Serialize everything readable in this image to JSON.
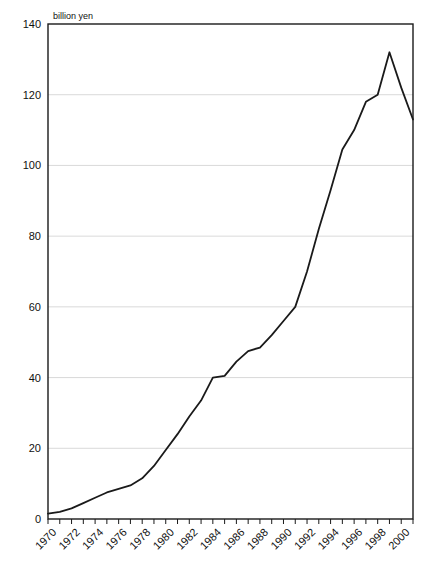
{
  "chart_data": {
    "type": "line",
    "title": "",
    "subtitle": "",
    "xlabel": "",
    "ylabel": "",
    "unit_label": "billion yen",
    "grid": true,
    "legend": "none",
    "xlim": [
      1970,
      2001
    ],
    "ylim": [
      0,
      140
    ],
    "ytick_values": [
      0,
      20,
      40,
      60,
      80,
      100,
      120,
      140
    ],
    "ytick_labels": [
      "0",
      "20",
      "40",
      "60",
      "80",
      "100",
      "120",
      "140"
    ],
    "xtick_labels": [
      "1970",
      "1972",
      "1974",
      "1976",
      "1978",
      "1980",
      "1982",
      "1984",
      "1986",
      "1988",
      "1990",
      "1992",
      "1994",
      "1996",
      "1998",
      "2000"
    ],
    "xtick_label_years": [
      1970,
      1972,
      1974,
      1976,
      1978,
      1980,
      1982,
      1984,
      1986,
      1988,
      1990,
      1992,
      1994,
      1996,
      1998,
      2000
    ],
    "xtick_minor_years": [
      1970,
      1971,
      1972,
      1973,
      1974,
      1975,
      1976,
      1977,
      1978,
      1979,
      1980,
      1981,
      1982,
      1983,
      1984,
      1985,
      1986,
      1987,
      1988,
      1989,
      1990,
      1991,
      1992,
      1993,
      1994,
      1995,
      1996,
      1997,
      1998,
      1999,
      2000,
      2001
    ],
    "series": [
      {
        "name": "billion yen",
        "color": "#1a1a1a",
        "x": [
          1970,
          1971,
          1972,
          1973,
          1974,
          1975,
          1976,
          1977,
          1978,
          1979,
          1980,
          1981,
          1982,
          1983,
          1984,
          1985,
          1986,
          1987,
          1988,
          1989,
          1990,
          1991,
          1992,
          1993,
          1994,
          1995,
          1996,
          1997,
          1998,
          1999,
          2000,
          2001
        ],
        "values": [
          1.5,
          2.0,
          3.0,
          4.5,
          6.0,
          7.5,
          8.5,
          9.5,
          11.5,
          15.0,
          19.5,
          24.0,
          29.0,
          33.5,
          40.0,
          40.5,
          44.5,
          47.5,
          48.5,
          52.0,
          56.0,
          60.0,
          70.0,
          82.0,
          93.0,
          104.5,
          110.0,
          118.0,
          120.0,
          132.0,
          122.0,
          113.0
        ]
      }
    ]
  },
  "axes": {
    "unit_text": "billion yen"
  }
}
